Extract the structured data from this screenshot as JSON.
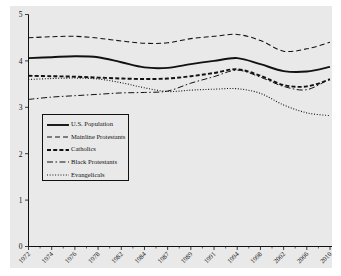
{
  "chart_data": {
    "type": "line",
    "title": "",
    "xlabel": "",
    "ylabel": "",
    "ylim": [
      0,
      5
    ],
    "yticks": [
      "0",
      "1",
      "2",
      "3",
      "4",
      "5"
    ],
    "grid": false,
    "legend_position": "inner-left",
    "background_color": "#e9e9e9",
    "line_color": "#111111",
    "x": [
      1972,
      1974,
      1976,
      1978,
      1982,
      1984,
      1987,
      1989,
      1991,
      1994,
      1998,
      2002,
      2006,
      2010
    ],
    "xtick_labels": [
      "1972",
      "1974",
      "1976",
      "1978",
      "1982",
      "1984",
      "1987",
      "1989",
      "1991",
      "1994",
      "1998",
      "2002",
      "2006",
      "2010"
    ],
    "series": [
      {
        "name": "U.S. Population",
        "style": "solid",
        "values": [
          4.06,
          4.08,
          4.1,
          4.08,
          3.97,
          3.86,
          3.85,
          3.93,
          4.0,
          4.06,
          3.93,
          3.78,
          3.77,
          3.87
        ]
      },
      {
        "name": "Mainline Protestants",
        "style": "dashed",
        "values": [
          4.5,
          4.52,
          4.53,
          4.49,
          4.43,
          4.38,
          4.39,
          4.48,
          4.53,
          4.57,
          4.44,
          4.21,
          4.26,
          4.4
        ]
      },
      {
        "name": "Catholics",
        "style": "thick-dashed",
        "values": [
          3.68,
          3.67,
          3.66,
          3.64,
          3.62,
          3.61,
          3.62,
          3.67,
          3.74,
          3.82,
          3.68,
          3.48,
          3.45,
          3.6
        ]
      },
      {
        "name": "Black Protestants",
        "style": "dash-dot",
        "values": [
          3.17,
          3.22,
          3.25,
          3.28,
          3.31,
          3.32,
          3.35,
          3.52,
          3.66,
          3.8,
          3.65,
          3.45,
          3.38,
          3.62
        ]
      },
      {
        "name": "Evangelicals",
        "style": "dotted",
        "values": [
          3.6,
          3.62,
          3.63,
          3.61,
          3.53,
          3.42,
          3.34,
          3.37,
          3.39,
          3.4,
          3.3,
          3.05,
          2.88,
          2.82
        ]
      }
    ]
  },
  "legend": {
    "items": [
      {
        "label": "U.S. Population",
        "style": "solid"
      },
      {
        "label": "Mainline Protestants",
        "style": "dashed"
      },
      {
        "label": "Catholics",
        "style": "thick-dashed"
      },
      {
        "label": "Black Protestants",
        "style": "dash-dot"
      },
      {
        "label": "Evangelicals",
        "style": "dotted"
      }
    ]
  }
}
